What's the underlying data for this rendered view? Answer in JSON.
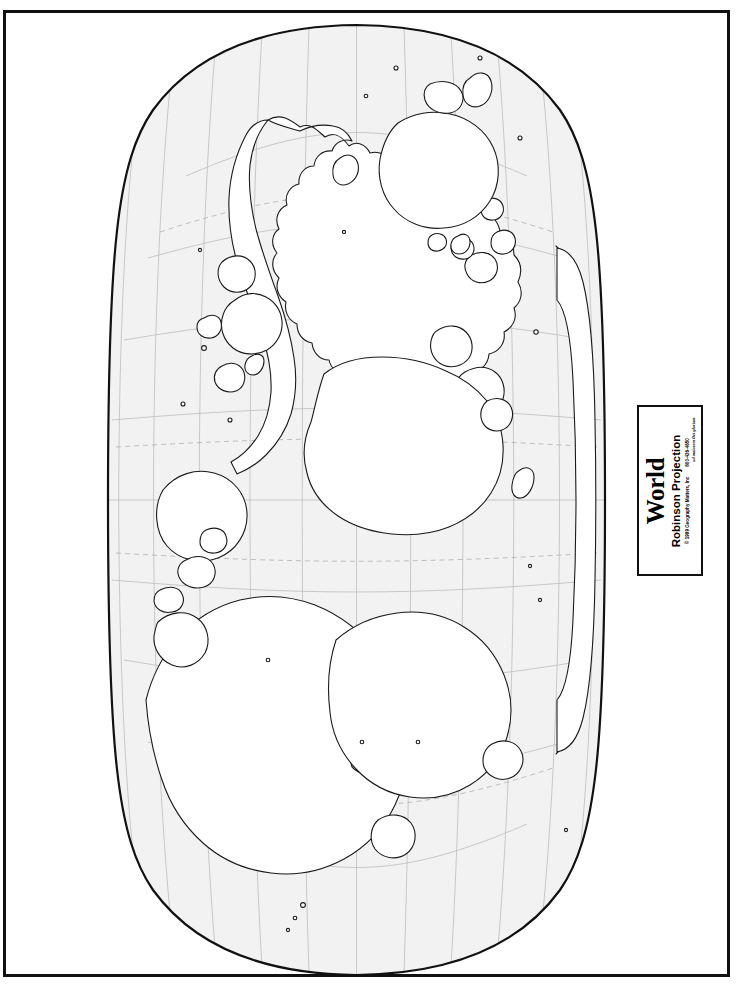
{
  "page": {
    "width": 744,
    "height": 987,
    "background": "#ffffff",
    "frame_color": "#111111"
  },
  "title_box": {
    "title": "World",
    "subtitle": "Robinson Projection",
    "copyright": "© 1999 Geography Matters, Inc",
    "motto": "ad maiorem Dei gloriam",
    "phone": "800-426-4650",
    "rotation_degrees": -90,
    "border_color": "#111111"
  },
  "map": {
    "name": "World Robinson Projection outline map",
    "projection": "Robinson",
    "rotation_degrees": -90,
    "outline_color": "#111111",
    "land_fill": "#ffffff",
    "ocean_fill": "#f2f2f2",
    "graticule_color": "#b9b9b9",
    "graticule_dashed_color": "#b0b0b0",
    "graticule_interval_degrees": 30,
    "special_parallels": [
      "Tropic of Cancer",
      "Tropic of Capricorn",
      "Arctic Circle",
      "Antarctic Circle"
    ],
    "labels_shown": false,
    "bounds_px": {
      "left": 108,
      "top": 25,
      "right": 605,
      "bottom": 975
    },
    "continents": [
      "Asia",
      "Europe",
      "Africa",
      "North America",
      "South America",
      "Australia",
      "Antarctica",
      "Greenland"
    ]
  }
}
